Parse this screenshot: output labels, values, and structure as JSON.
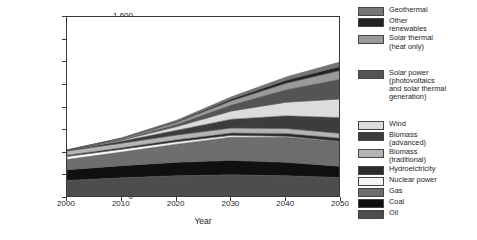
{
  "chart_data": {
    "type": "area",
    "title": "",
    "xlabel": "Year",
    "ylabel": "Primary energy use (EJ/a)",
    "x": [
      2000,
      2010,
      2020,
      2030,
      2040,
      2050
    ],
    "xlim": [
      2000,
      2050
    ],
    "ylim": [
      0,
      1600
    ],
    "yticks": [
      0,
      200,
      400,
      600,
      800,
      1000,
      1200,
      1400,
      1600
    ],
    "ytick_labels": [
      "0",
      "200",
      "400",
      "600",
      "800",
      "1,000",
      "1,200",
      "1,400",
      "1,600"
    ],
    "xticks": [
      2000,
      2010,
      2020,
      2030,
      2040,
      2050
    ],
    "xtick_labels": [
      "2000",
      "2010",
      "2020",
      "2030",
      "2040",
      "2050"
    ],
    "grid": false,
    "legend_position": "right",
    "stacked": true,
    "series": [
      {
        "name": "Oil",
        "color": "#4d4d4d",
        "values": [
          155,
          178,
          196,
          205,
          196,
          180
        ]
      },
      {
        "name": "Coal",
        "color": "#101010",
        "values": [
          95,
          108,
          120,
          128,
          120,
          100
        ]
      },
      {
        "name": "Gas",
        "color": "#6e6e6e",
        "values": [
          90,
          120,
          160,
          205,
          220,
          215
        ]
      },
      {
        "name": "Nuclear power",
        "color": "#f7f7f7",
        "values": [
          28,
          26,
          22,
          16,
          10,
          6
        ]
      },
      {
        "name": "Hydroelctricity",
        "color": "#2b2b2b",
        "values": [
          10,
          13,
          17,
          21,
          25,
          28
        ]
      },
      {
        "name": "Biomass (traditional)",
        "color": "#b5b5b5",
        "values": [
          38,
          40,
          42,
          44,
          44,
          42
        ]
      },
      {
        "name": "Biomass (advanced)",
        "color": "#3c3c3c",
        "values": [
          4,
          18,
          42,
          78,
          112,
          140
        ]
      },
      {
        "name": "Wind",
        "color": "#dcdcdc",
        "values": [
          1,
          10,
          32,
          72,
          120,
          165
        ]
      },
      {
        "name": "Solar power (photovoltaics and solar thermal generation)",
        "color": "#545454",
        "values": [
          0,
          4,
          18,
          52,
          110,
          175
        ]
      },
      {
        "name": "Solar thermal (heat only)",
        "color": "#9a9a9a",
        "values": [
          2,
          8,
          20,
          38,
          58,
          78
        ]
      },
      {
        "name": "Other renewables",
        "color": "#232323",
        "values": [
          1,
          3,
          8,
          16,
          26,
          36
        ]
      },
      {
        "name": "Geothermal",
        "color": "#757575",
        "values": [
          1,
          4,
          10,
          19,
          29,
          40
        ]
      }
    ]
  },
  "legend": {
    "top_group": [
      {
        "label": "Geothermal",
        "color": "#757575",
        "name": "geothermal"
      },
      {
        "label": "Other\nrenewables",
        "color": "#232323",
        "name": "other-renewables"
      },
      {
        "label": "Solar thermal\n(heat only)",
        "color": "#9a9a9a",
        "name": "solar-thermal-heat-only"
      }
    ],
    "middle_group": [
      {
        "label": "Solar power\n(photovoltaics\nand solar thermal\ngeneration)",
        "color": "#545454",
        "name": "solar-power"
      }
    ],
    "bottom_group": [
      {
        "label": "Wind",
        "color": "#dcdcdc",
        "name": "wind"
      },
      {
        "label": "Biomass\n(advanced)",
        "color": "#3c3c3c",
        "name": "biomass-advanced"
      },
      {
        "label": "Biomass\n(traditional)",
        "color": "#b5b5b5",
        "name": "biomass-traditional"
      },
      {
        "label": "Hydroelctricity",
        "color": "#2b2b2b",
        "name": "hydroelectricity"
      },
      {
        "label": "Nuclear power",
        "color": "#f7f7f7",
        "name": "nuclear-power"
      },
      {
        "label": "Gas",
        "color": "#6e6e6e",
        "name": "gas"
      },
      {
        "label": "Coal",
        "color": "#101010",
        "name": "coal"
      },
      {
        "label": "Oil",
        "color": "#4d4d4d",
        "name": "oil"
      }
    ]
  }
}
